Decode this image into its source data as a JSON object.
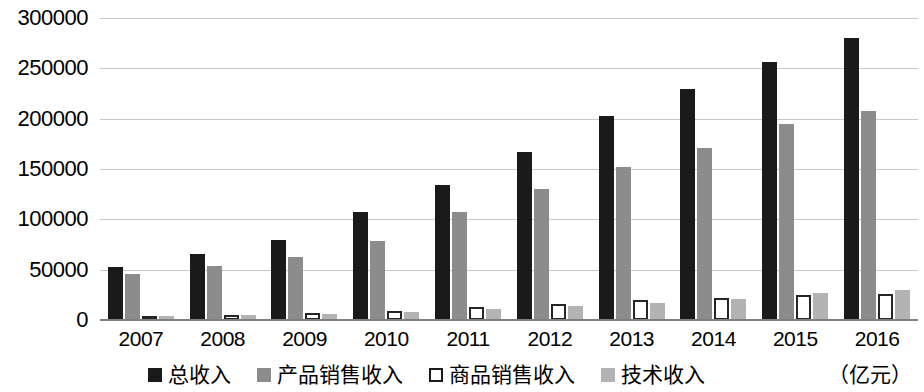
{
  "chart_data": {
    "type": "bar",
    "title": "",
    "xlabel": "",
    "ylabel": "",
    "unit_label": "（亿元）",
    "grid": true,
    "legend_position": "bottom",
    "ylim": [
      0,
      300000
    ],
    "ytick_step": 50000,
    "ytick_labels": [
      "300000",
      "250000",
      "200000",
      "150000",
      "100000",
      "50000",
      "0"
    ],
    "ytick_values": [
      300000,
      250000,
      200000,
      150000,
      100000,
      50000,
      0
    ],
    "categories": [
      "2007",
      "2008",
      "2009",
      "2010",
      "2011",
      "2012",
      "2013",
      "2014",
      "2015",
      "2016"
    ],
    "series": [
      {
        "name": "总收入",
        "color": "#1a1a1a",
        "swatch": "filled-black",
        "values": [
          53000,
          66000,
          79000,
          107000,
          134000,
          167000,
          203000,
          229000,
          256000,
          280000
        ]
      },
      {
        "name": "产品销售收入",
        "color": "#8c8c8c",
        "swatch": "filled-gray",
        "values": [
          46000,
          54000,
          63000,
          78000,
          107000,
          130000,
          152000,
          171000,
          195000,
          208000
        ]
      },
      {
        "name": "商品销售收入",
        "color": "#ffffff",
        "swatch": "hollow",
        "values": [
          4000,
          5000,
          7000,
          9000,
          13000,
          16000,
          20000,
          22000,
          25000,
          26000
        ]
      },
      {
        "name": "技术收入",
        "color": "#b3b3b3",
        "swatch": "filled-lightgray",
        "values": [
          3500,
          4500,
          6000,
          8000,
          11000,
          14000,
          17000,
          21000,
          27000,
          30000
        ]
      }
    ]
  }
}
